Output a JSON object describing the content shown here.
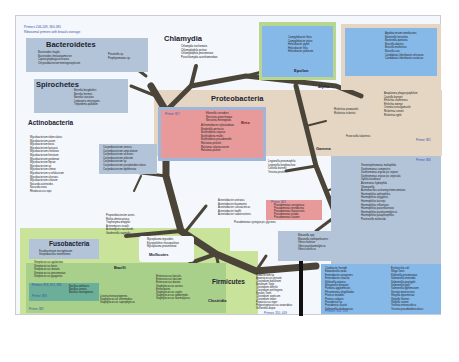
{
  "header": {
    "line1": "Primers 246-249, 360-381",
    "line2": "Ribosomal primers with broad coverage"
  },
  "groups": {
    "bacteroidetes": {
      "title": "Bacteroidetes",
      "species_left": [
        "Bacteroides fragilis",
        "Bacteroides thetaiotaomicron",
        "Capnocytophaga ochracea",
        "Chryseobacterium meningosepticum"
      ],
      "species_right": [
        "Prevotella sp.",
        "Porphyromonas sp."
      ]
    },
    "spirochetes": {
      "title": "Spirochetes",
      "species": [
        "Borrelia burgdorferi",
        "Borrelia hermsii",
        "Borrelia turicatae",
        "Leptospira interrogans",
        "Treponema pallidum"
      ]
    },
    "chlamydia": {
      "title": "Chlamydia",
      "species": [
        "Chlamydia trachomatis",
        "Chlamydophila psittaci",
        "Chlamydophila pneumoniae",
        "Parachlamydia acanthamoebae"
      ]
    },
    "epsilon": {
      "title": "Epsilon",
      "species": [
        "Campylobacter fetus",
        "Campylobacter jejuni",
        "Helicobacter pylori",
        "Helicobacter felis",
        "Helicobacter pullorum"
      ]
    },
    "alpha_box": {
      "species": [
        "Agrobacterium tumefaciens",
        "Bartonella henselae",
        "Bartonella quintana",
        "Brucella abortus",
        "Brucella melitensis",
        "Brucella suis",
        "Candidatus Liberibacter africanus",
        "Candidatus Liberibacter asiaticus"
      ]
    },
    "alpha": {
      "title": "Alpha",
      "species": [
        "Anaplasma phagocytophilum",
        "Coxiella burnetii",
        "Ehrlichia chaffeensis",
        "Ehrlichia ewingii",
        "Orientia tsutsugamushi",
        "Rickettsia conorii",
        "Rickettsia prowazekii",
        "Rickettsia rickettsii",
        "Rickettsia typhi"
      ],
      "primer": "Primer 382"
    },
    "proteobacteria": {
      "title": "Proteobacteria"
    },
    "beta": {
      "title": "Beta",
      "primer": "Primer 357",
      "species": [
        "Eikenella corrodens",
        "Neisseria gonorrhoeae",
        "Neisseria meningitidis",
        "Achromobacter xylosoxidans",
        "Bordetella pertussis",
        "Burkholderia cepacia",
        "Burkholderia mallei",
        "Burkholderia pseudomallei",
        "Ralstonia pickettii",
        "Ralstonia solanacearum",
        "Ralstonia picketii"
      ]
    },
    "gamma": {
      "title": "Gamma",
      "francisella": "Francisella tularensis",
      "species": [
        "Legionella pneumophila",
        "Legionella longbeachae",
        "Coxiella burnetii",
        "Yersinia pestis"
      ],
      "acinetobacter": [
        "Acinetobacter anitratus",
        "Acinetobacter baumannii",
        "Acinetobacter calcoaceticus",
        "Acinetobacter lwoffii",
        "Acinetobacter radioresistens"
      ],
      "pseudomonas_extra": "Pseudomonas syringae pv. glycinea"
    },
    "pseudomonas": {
      "primer": "Primer 363",
      "species": [
        "Pseudomonas aeruginosa",
        "Pseudomonas mendocina",
        "Pseudomonas fluorescens",
        "Pseudomonas putida",
        "Pseudomonas stutzeri"
      ]
    },
    "primer384": {
      "primer": "Primer 384",
      "species": [
        "Stenotrophomonas maltophilia",
        "Xanthomonas campestris",
        "Xanthomonas oryzae pv. oryzae",
        "Xanthomonas oryzae pv. oryzicola",
        "Xylella fastidiosa",
        "Aeromonas hydrophila",
        "Shewanella",
        "Actinobacillus actinomycetemcomitans",
        "Haemophilus aphrophilus",
        "Haemophilus aegyptius",
        "Haemophilus ducreyi",
        "Haemophilus influenzae",
        "Haemophilus parainfluenzae",
        "Haemophilus parahaemolyticus",
        "Haemophilus paraphrophilus",
        "Pasteurella multocida"
      ]
    },
    "vibrio": {
      "species": [
        "Moraxella spp.",
        "Moraxella nonliquefaciens",
        "Vibrio cholerae",
        "Vibrio parahaemolyticus",
        "Vibrio vulnificus"
      ]
    },
    "enterics": {
      "primer": "Primers 358, 359",
      "species_left": [
        "Citrobacter freundii",
        "Edwardsiella tarda",
        "Enterobacter aerogenes",
        "Enterobacter cloacae",
        "Klebsiella oxytoca",
        "Morganella morganii",
        "Pantoea agglomerans",
        "Plesiomonas shigelloides",
        "Proteus mirabilis",
        "Proteus vulgaris",
        "Providencia sp.",
        "Providencia stuartii",
        "Salmonella choleraesuis"
      ],
      "species_right": [
        "Escherichia coli",
        "Shiga Toxin",
        "Klebsiella pneumoniae",
        "Salmonella enteritidis",
        "Salmonella paratyphi",
        "Salmonella typhi",
        "Salmonella typhimurium",
        "Serratia marcescens",
        "Shigella dysenteriae",
        "Shigella flexneri",
        "Shigella sonnei",
        "Yersinia enterocolitica",
        "Yersinia pseudotuberculosis",
        "Yersinia pestis"
      ]
    },
    "actinobacteria": {
      "title": "Actinobacteria",
      "mycobacteria": [
        "Mycobacterium tuberculosis",
        "Mycobacterium avium",
        "Mycobacterium bovis",
        "Mycobacterium kansasii",
        "Mycobacterium chelonae",
        "Mycobacterium fortuitum",
        "Mycobacterium gordonae",
        "Mycobacterium leprae",
        "Mycobacterium sp.",
        "Mycobacterium simiae",
        "Mycobacterium scrofulaceum",
        "Mycobacterium ulcerans",
        "Mycobacterium celatum",
        "Nocardia asteroides",
        "Nocardia nova",
        "Rhodococcus equi"
      ],
      "coryne": [
        "Corynebacterium xerosis",
        "Corynebacterium amycolatum",
        "Corynebacterium ulcerans",
        "Corynebacterium jeikeium",
        "Corynebacterium sp.",
        "Corynebacterium pseudotuberculosis",
        "Corynebacterium diphtheriae"
      ],
      "others": [
        "Propionibacterium acnes",
        "Rothia dentocariosa",
        "Tropheryma whipplei",
        "Actinomyces israelii",
        "Actinomyces naeslundii",
        "Gardnerella vaginalis"
      ]
    },
    "fusobacteria": {
      "title": "Fusobacteria",
      "species": [
        "Fusobacterium necrophorum",
        "Streptobacillus moniliformis"
      ]
    },
    "mollicutes": {
      "title": "Mollicutes",
      "species": [
        "Mycoplasma mycoides",
        "Erysipelothrix rhusiopathiae",
        "Mycoplasma pneumoniae"
      ]
    },
    "bacilli": {
      "title": "Bacilli",
      "primer_a": "Primers 353, 357, 382",
      "primer_b": "Primer 383",
      "primer_c": "Primer 382",
      "species": [
        "Streptococcus agalactiae",
        "Streptococcus bovis",
        "Streptococcus mutans",
        "Streptococcus pneumoniae",
        "Streptococcus pyogenes",
        "Streptococcus oralis",
        "Streptococcus mitis",
        "Streptococcus sanguinis",
        "Bacillus anthracis",
        "Bacillus cereus",
        "Bacillus thuringiensis",
        "Listeria monocytogenes",
        "Staphylococcus intermedius",
        "Staphylococcus saprophyticus",
        "Enterococcus faecalis",
        "Enterococcus faecium",
        "Enterococcus durans",
        "Staphylococcus aureus",
        "Enterotoxins",
        "Staphylococcus capitis",
        "Staphylococcus epidermidis",
        "Staphylococcus haemolyticus"
      ]
    },
    "firmicutes": {
      "title": "Firmicutes",
      "subtitle": "Clostridia",
      "primer": "Primers 350, 449",
      "species": [
        "Eubacterium sp.",
        "Anaerococcus prevotii",
        "Clostridium botulinum",
        "Botulinum Toxin",
        "Clostridium difficile",
        "Clostridium perfringens",
        "Epsilon Toxin",
        "Clostridium septicum",
        "Clostridium tetani",
        "Peptococcus niger",
        "Peptostreptococcus anaerobius",
        "Veillonella dispar"
      ]
    }
  },
  "colors": {
    "tree": "#4a4538",
    "proteo_bg": "#e5d6c3",
    "blue_box": "#86b8e8",
    "grey_blue_box": "#b3c4d8",
    "pink_box": "#e89a9a",
    "green_bg": "#c9e39a",
    "green_box": "#a9d08b",
    "teal_box": "#6bae9a",
    "epsilon_border": "#b9d68f"
  }
}
